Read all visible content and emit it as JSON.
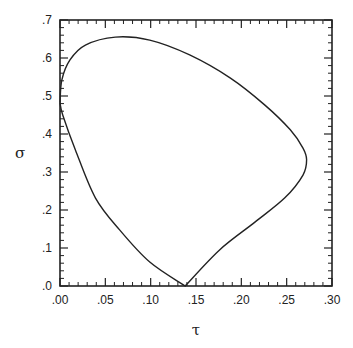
{
  "chart_data": {
    "type": "line",
    "title": "",
    "xlabel": "τ",
    "ylabel": "σ",
    "xlim": [
      0.0,
      0.3
    ],
    "ylim": [
      0.0,
      0.7
    ],
    "grid": false,
    "legend": null,
    "x_ticks": [
      0.0,
      0.05,
      0.1,
      0.15,
      0.2,
      0.25,
      0.3
    ],
    "x_tick_labels": [
      ".00",
      ".05",
      ".10",
      ".15",
      ".20",
      ".25",
      ".30"
    ],
    "y_ticks": [
      0.0,
      0.1,
      0.2,
      0.3,
      0.4,
      0.5,
      0.6,
      0.7
    ],
    "y_tick_labels": [
      ".0",
      ".1",
      ".2",
      ".3",
      ".4",
      ".5",
      ".6",
      ".7"
    ],
    "x_minor_per_major": 5,
    "y_minor_per_major": 5,
    "series": [
      {
        "name": "closed curve",
        "color": "#222222",
        "x": [
          0.0,
          0.002,
          0.011,
          0.028,
          0.061,
          0.099,
          0.143,
          0.188,
          0.226,
          0.254,
          0.268,
          0.272,
          0.268,
          0.248,
          0.215,
          0.176,
          0.138,
          0.099,
          0.066,
          0.039,
          0.017,
          0.003,
          0.0
        ],
        "y": [
          0.482,
          0.542,
          0.595,
          0.634,
          0.655,
          0.647,
          0.608,
          0.547,
          0.476,
          0.411,
          0.363,
          0.332,
          0.292,
          0.232,
          0.168,
          0.095,
          0.0,
          0.063,
          0.147,
          0.232,
          0.358,
          0.45,
          0.482
        ],
        "cusp_after_index": 16
      }
    ]
  },
  "axes": {
    "xlabel": "τ",
    "ylabel": "σ"
  }
}
